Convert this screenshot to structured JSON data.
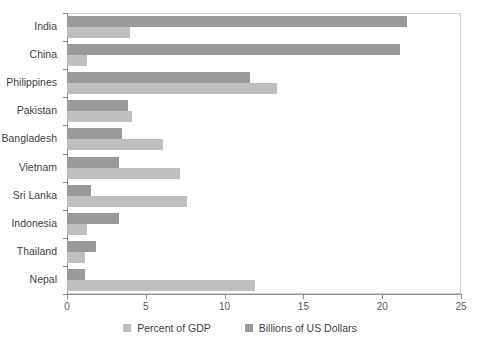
{
  "chart_data": {
    "type": "bar",
    "orientation": "horizontal",
    "title": "",
    "subtitle": "",
    "xlabel": "",
    "ylabel": "",
    "xlim": [
      0,
      25
    ],
    "xticks": [
      "0",
      "5",
      "10",
      "15",
      "20",
      "25"
    ],
    "grid": false,
    "legend_position": "bottom-center",
    "categories": [
      "India",
      "China",
      "Philippines",
      "Pakistan",
      "Bangladesh",
      "Vietnam",
      "Sri Lanka",
      "Indonesia",
      "Thailand",
      "Nepal"
    ],
    "series": [
      {
        "name": "Billions of US Dollars",
        "color": "#9a9a9a",
        "values": [
          21.6,
          21.1,
          11.6,
          3.9,
          3.5,
          3.3,
          1.5,
          3.3,
          1.85,
          1.15
        ]
      },
      {
        "name": "Percent of GDP",
        "color": "#bfbfbf",
        "values": [
          4.0,
          1.25,
          13.3,
          4.15,
          6.1,
          7.2,
          7.6,
          1.3,
          1.15,
          11.9
        ]
      }
    ]
  },
  "legend": {
    "items": [
      {
        "label": "Percent of GDP",
        "color": "#bfbfbf"
      },
      {
        "label": "Billions of US Dollars",
        "color": "#9a9a9a"
      }
    ]
  },
  "axis": {
    "x_tick_labels": [
      "0",
      "5",
      "10",
      "15",
      "20",
      "25"
    ]
  }
}
